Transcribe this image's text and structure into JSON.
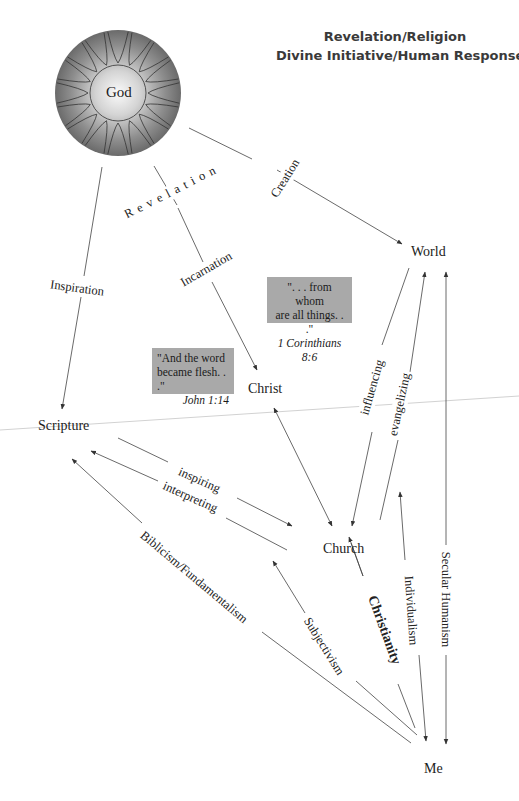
{
  "title": {
    "line1": "Revelation/Religion",
    "line2": "Divine Initiative/Human Response"
  },
  "nodes": {
    "god": "God",
    "world": "World",
    "christ": "Christ",
    "scripture": "Scripture",
    "church": "Church",
    "me": "Me"
  },
  "edge_labels": {
    "revelation": "R e v e l a t i o n",
    "creation": "Creation",
    "inspiration": "Inspiration",
    "incarnation": "Incarnation",
    "influencing": "influencing",
    "evangelizing": "evangelizing",
    "inspiring": "inspiring",
    "interpreting": "interpreting",
    "biblicism": "Biblicism/Fundamentalism",
    "subjectivism": "Subjectivism",
    "christianity": "Christianity",
    "individualism": "Individualism",
    "secular_humanism": "Secular Humanism"
  },
  "quotes": {
    "corinthians": {
      "line1": "\". . . from whom",
      "line2": "are all things. . .\"",
      "ref": "1 Corinthians 8:6"
    },
    "john": {
      "line1": "\"And the word",
      "line2": "became flesh. . .\"",
      "ref": "John 1:14"
    }
  },
  "colors": {
    "line": "#444444",
    "quote_bg": "#a9a9a9",
    "sphere_dark": "#6e6e6e",
    "sphere_light": "#f2f2f2"
  }
}
